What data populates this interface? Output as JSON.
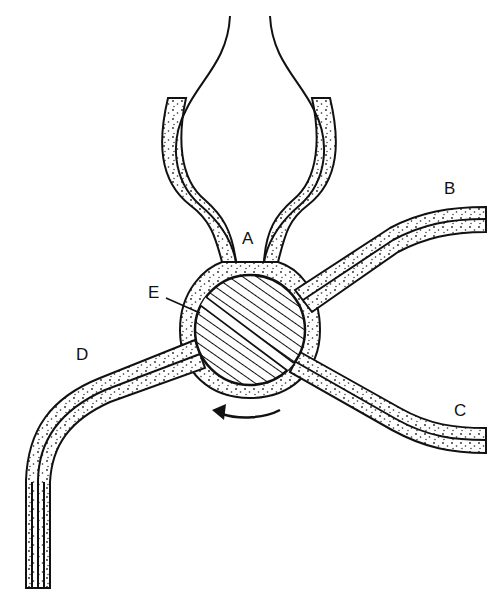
{
  "diagram": {
    "type": "stopcock-valve-schematic",
    "labels": {
      "A": "A",
      "B": "B",
      "C": "C",
      "D": "D",
      "E": "E"
    },
    "components": {
      "reservoir": "upper bulb connecting via port A",
      "plug": "hatched rotating plug with bore (E)",
      "outlets": [
        "B",
        "C",
        "D"
      ],
      "rotation": "counter-clockwise arrow"
    },
    "colors": {
      "stroke": "#111111",
      "fill": "#ffffff",
      "stipple": "#222222"
    }
  }
}
